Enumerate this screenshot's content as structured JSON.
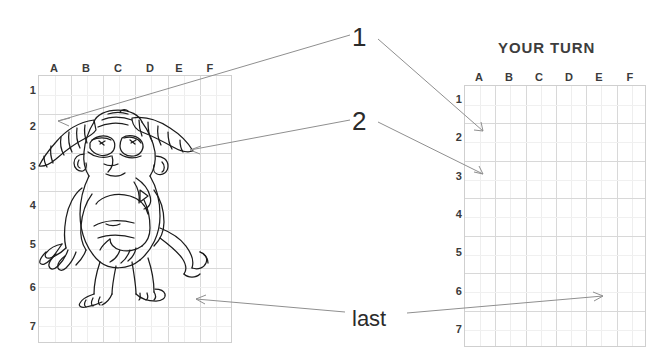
{
  "title": {
    "your_turn": "YOUR TURN"
  },
  "callouts": [
    {
      "id": "callout-1",
      "label": "1"
    },
    {
      "id": "callout-2",
      "label": "2"
    },
    {
      "id": "callout-last",
      "label": "last"
    }
  ],
  "left_grid": {
    "name": "reference-grid",
    "columns": [
      "A",
      "B",
      "C",
      "D",
      "E",
      "F"
    ],
    "rows": [
      "1",
      "2",
      "3",
      "4",
      "5",
      "6",
      "7"
    ],
    "content": "cartoon-monster-line-drawing"
  },
  "right_grid": {
    "name": "practice-grid",
    "columns": [
      "A",
      "B",
      "C",
      "D",
      "E",
      "F"
    ],
    "rows": [
      "1",
      "2",
      "3",
      "4",
      "5",
      "6",
      "7"
    ],
    "content": "empty"
  },
  "annotations": [
    {
      "label": "1",
      "from_cell": "A2-left",
      "to_cell": "A2-right"
    },
    {
      "label": "2",
      "from_cell": "A3-left",
      "to_cell": "A3-right"
    },
    {
      "label": "last",
      "from_cell": "D6-left",
      "to_cell": "E6-right"
    }
  ],
  "colors": {
    "ink": "#2b2b2b",
    "grid_line": "#d8d8d8",
    "grid_border": "#cfcfcf",
    "grid_sub_line": "#eeeeee",
    "arrow": "#8a8a8a",
    "label": "#3a3a3a",
    "background": "#ffffff"
  }
}
